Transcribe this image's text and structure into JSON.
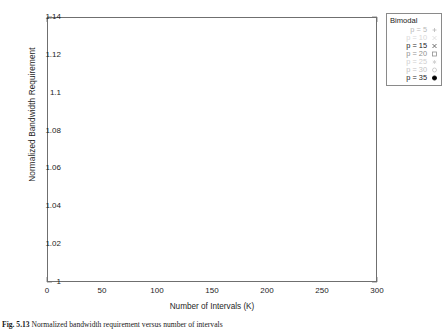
{
  "figure": {
    "caption_label": "Fig. 5.13",
    "caption_text": "Normalized bandwidth requirement versus number of intervals"
  },
  "axes": {
    "ylabel": "Normalized Bandwidth Requirement",
    "xlabel": "Number of Intervals (K)",
    "yticks": [
      "1",
      "1.02",
      "1.04",
      "1.06",
      "1.08",
      "1.1",
      "1.12",
      "1.14"
    ],
    "xticks": [
      "0",
      "50",
      "100",
      "150",
      "200",
      "250",
      "300"
    ]
  },
  "legend": {
    "title": "Bimodal",
    "entries": [
      {
        "label": "p = 5",
        "marker": "plus-marker",
        "color": "#b8b8b8"
      },
      {
        "label": "p = 10",
        "marker": "cross-marker",
        "color": "#d8d8d8"
      },
      {
        "label": "p = 15",
        "marker": "x-marker",
        "color": "#4a4a4a"
      },
      {
        "label": "p = 20",
        "marker": "open-square-marker",
        "color": "#8f8f8f"
      },
      {
        "label": "p = 25",
        "marker": "asterisk-marker",
        "color": "#cfcfcf"
      },
      {
        "label": "p = 30",
        "marker": "open-circle-marker",
        "color": "#c2c2c2"
      },
      {
        "label": "p = 35",
        "marker": "filled-circle-marker",
        "color": "#000000"
      }
    ]
  },
  "chart_data": {
    "type": "line",
    "title": "",
    "xlabel": "Number of Intervals (K)",
    "ylabel": "Normalized Bandwidth Requirement",
    "xlim": [
      0,
      300
    ],
    "ylim": [
      1.0,
      1.14
    ],
    "grid": false,
    "legend_position": "outside-top-right",
    "legend_title": "Bimodal",
    "x": [
      5,
      10,
      15,
      20,
      25,
      30,
      35,
      40,
      45,
      50,
      55,
      60,
      65,
      70,
      75,
      80,
      85,
      90,
      95,
      100,
      105,
      110,
      115,
      120,
      125,
      130,
      135,
      140,
      145,
      150,
      155,
      160,
      165,
      170,
      175,
      180,
      185,
      190,
      195,
      200,
      205,
      210,
      215,
      220,
      225,
      230,
      235,
      240,
      245,
      250,
      255,
      260,
      265,
      270,
      275,
      280,
      285,
      290,
      295,
      300
    ],
    "series": [
      {
        "name": "p = 5",
        "marker": "plus-marker",
        "color": "#b8b8b8",
        "line": true,
        "values": [
          1.136,
          1.135,
          1.1,
          1.112,
          1.118,
          1.117,
          1.121,
          1.103,
          1.107,
          1.11,
          1.114,
          1.116,
          1.108,
          1.105,
          1.112,
          1.113,
          1.109,
          1.106,
          1.11,
          1.112,
          1.108,
          1.105,
          1.107,
          1.11,
          1.112,
          1.107,
          1.105,
          1.108,
          1.11,
          1.109,
          1.106,
          1.108,
          1.11,
          1.111,
          1.107,
          1.105,
          1.107,
          1.109,
          1.11,
          1.107,
          1.105,
          1.107,
          1.109,
          1.11,
          1.108,
          1.106,
          1.107,
          1.109,
          1.11,
          1.108,
          1.106,
          1.107,
          1.108,
          1.109,
          1.107,
          1.106,
          1.107,
          1.108,
          1.109,
          1.107
        ]
      },
      {
        "name": "p = 10",
        "marker": "cross-marker",
        "color": "#d8d8d8",
        "line": true,
        "values": [
          1.104,
          1.09,
          1.078,
          1.072,
          1.069,
          1.067,
          1.065,
          1.064,
          1.063,
          1.0625,
          1.062,
          1.0615,
          1.061,
          1.0608,
          1.0605,
          1.0602,
          1.06,
          1.0598,
          1.0596,
          1.0595,
          1.0594,
          1.0593,
          1.0592,
          1.0591,
          1.059,
          1.059,
          1.0589,
          1.0589,
          1.0588,
          1.0588,
          1.0587,
          1.0587,
          1.0586,
          1.0586,
          1.0586,
          1.0585,
          1.0585,
          1.0585,
          1.0584,
          1.0584,
          1.0584,
          1.0584,
          1.0583,
          1.0583,
          1.0583,
          1.0583,
          1.0583,
          1.0582,
          1.0582,
          1.0582,
          1.0582,
          1.0582,
          1.0582,
          1.0582,
          1.0581,
          1.0581,
          1.0581,
          1.0581,
          1.0581,
          1.0581
        ]
      },
      {
        "name": "p = 15",
        "marker": "x-marker",
        "color": "#4a4a4a",
        "line": false,
        "values": [
          1.072,
          1.06,
          1.051,
          1.046,
          1.0435,
          1.0425,
          1.0405,
          1.0418,
          1.0425,
          1.0415,
          1.0398,
          1.0392,
          1.0405,
          1.0418,
          1.0422,
          1.0408,
          1.0398,
          1.0395,
          1.0402,
          1.0412,
          1.0415,
          1.0408,
          1.04,
          1.0398,
          1.0402,
          1.0408,
          1.0412,
          1.0405,
          1.0398,
          1.0396,
          1.04,
          1.0406,
          1.041,
          1.0404,
          1.0397,
          1.0395,
          1.0399,
          1.0404,
          1.0408,
          1.0402,
          1.0396,
          1.0394,
          1.0398,
          1.0402,
          1.0406,
          1.0401,
          1.0395,
          1.0394,
          1.0397,
          1.0401,
          1.0404,
          1.0399,
          1.0394,
          1.0393,
          1.0396,
          1.04,
          1.0403,
          1.0398,
          1.0394,
          1.0396
        ]
      },
      {
        "name": "p = 20",
        "marker": "open-square-marker",
        "color": "#8f8f8f",
        "line": false,
        "values": [
          1.056,
          1.046,
          1.038,
          1.034,
          1.0318,
          1.0305,
          1.0295,
          1.0292,
          1.0288,
          1.0284,
          1.0282,
          1.028,
          1.0284,
          1.0286,
          1.0282,
          1.0279,
          1.0277,
          1.028,
          1.0283,
          1.0281,
          1.0278,
          1.0276,
          1.0278,
          1.0281,
          1.028,
          1.0277,
          1.0275,
          1.0277,
          1.028,
          1.0279,
          1.0276,
          1.0275,
          1.0277,
          1.0279,
          1.0278,
          1.0276,
          1.0274,
          1.0276,
          1.0278,
          1.0277,
          1.0275,
          1.0274,
          1.0276,
          1.0278,
          1.0277,
          1.0275,
          1.0274,
          1.0275,
          1.0277,
          1.0276,
          1.0274,
          1.0273,
          1.0275,
          1.0276,
          1.0275,
          1.0274,
          1.0273,
          1.0275,
          1.0276,
          1.0274
        ]
      },
      {
        "name": "p = 25",
        "marker": "asterisk-marker",
        "color": "#cfcfcf",
        "line": false,
        "values": [
          1.048,
          1.04,
          1.033,
          1.0295,
          1.0275,
          1.0262,
          1.0254,
          1.0249,
          1.0245,
          1.0242,
          1.024,
          1.0238,
          1.024,
          1.0242,
          1.0239,
          1.0237,
          1.0236,
          1.0238,
          1.024,
          1.0238,
          1.0236,
          1.0235,
          1.0237,
          1.0239,
          1.0237,
          1.0235,
          1.0234,
          1.0236,
          1.0238,
          1.0236,
          1.0234,
          1.0233,
          1.0235,
          1.0237,
          1.0236,
          1.0234,
          1.0233,
          1.0234,
          1.0236,
          1.0235,
          1.0233,
          1.0232,
          1.0234,
          1.0235,
          1.0234,
          1.0233,
          1.0232,
          1.0233,
          1.0235,
          1.0234,
          1.0232,
          1.0232,
          1.0233,
          1.0234,
          1.0233,
          1.0232,
          1.0231,
          1.0233,
          1.0234,
          1.0232
        ]
      },
      {
        "name": "p = 30",
        "marker": "open-circle-marker",
        "color": "#c2c2c2",
        "line": false,
        "values": [
          1.042,
          1.035,
          1.029,
          1.0262,
          1.0243,
          1.0232,
          1.0224,
          1.0219,
          1.0216,
          1.0213,
          1.0211,
          1.021,
          1.0211,
          1.0213,
          1.0211,
          1.0209,
          1.0208,
          1.021,
          1.0211,
          1.021,
          1.0208,
          1.0207,
          1.0209,
          1.021,
          1.0209,
          1.0207,
          1.0206,
          1.0208,
          1.0209,
          1.0208,
          1.0206,
          1.0206,
          1.0207,
          1.0209,
          1.0207,
          1.0206,
          1.0205,
          1.0207,
          1.0208,
          1.0207,
          1.0205,
          1.0205,
          1.0206,
          1.0207,
          1.0206,
          1.0205,
          1.0204,
          1.0206,
          1.0207,
          1.0206,
          1.0204,
          1.0204,
          1.0205,
          1.0206,
          1.0205,
          1.0204,
          1.0204,
          1.0205,
          1.0206,
          1.0204
        ]
      },
      {
        "name": "p = 35",
        "marker": "filled-circle-marker",
        "color": "#000000",
        "line": false,
        "values": [
          1.0375,
          1.0315,
          1.0268,
          1.0238,
          1.022,
          1.0208,
          1.02,
          1.0195,
          1.0191,
          1.0188,
          1.0186,
          1.0185,
          1.0186,
          1.0187,
          1.0185,
          1.0184,
          1.0183,
          1.0184,
          1.0186,
          1.0185,
          1.0183,
          1.0182,
          1.0184,
          1.0185,
          1.0184,
          1.0182,
          1.0181,
          1.0183,
          1.0184,
          1.0183,
          1.0181,
          1.0181,
          1.0182,
          1.0184,
          1.0182,
          1.0181,
          1.018,
          1.0182,
          1.0183,
          1.0182,
          1.018,
          1.018,
          1.0181,
          1.0182,
          1.0181,
          1.018,
          1.0179,
          1.0181,
          1.0182,
          1.0181,
          1.0179,
          1.0179,
          1.018,
          1.0181,
          1.018,
          1.0179,
          1.0179,
          1.018,
          1.0181,
          1.0179
        ]
      }
    ]
  }
}
